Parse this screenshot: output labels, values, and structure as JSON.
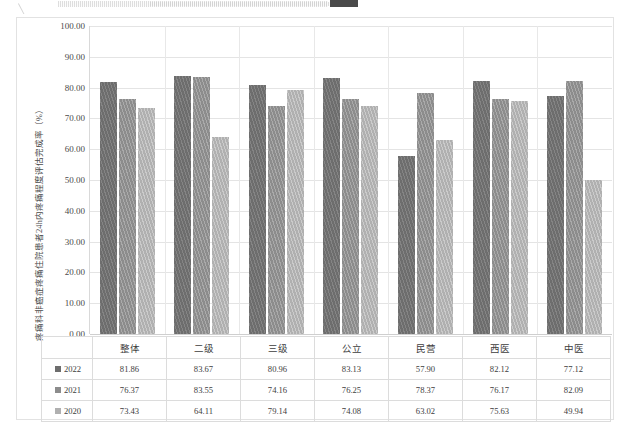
{
  "chart_data": {
    "type": "bar",
    "title": "",
    "xlabel": "",
    "ylabel": "疼痛科非癌症疼痛住院患者24h内疼痛程度评估完成率（%）",
    "ylim": [
      0,
      100
    ],
    "ytick_step": 10,
    "grid": true,
    "legend_position": "bottom",
    "categories": [
      "整体",
      "二级",
      "三级",
      "公立",
      "民营",
      "西医",
      "中医"
    ],
    "ytick_labels": [
      "100.00",
      "90.00",
      "80.00",
      "70.00",
      "60.00",
      "50.00",
      "40.00",
      "30.00",
      "20.00",
      "10.00",
      "0.00"
    ],
    "series": [
      {
        "name": "2022",
        "color": "#6d6d6d",
        "values": [
          81.86,
          83.67,
          80.96,
          83.13,
          57.9,
          82.12,
          77.12
        ]
      },
      {
        "name": "2021",
        "color": "#8c8c8c",
        "values": [
          76.37,
          83.55,
          74.16,
          76.25,
          78.37,
          76.17,
          82.09
        ]
      },
      {
        "name": "2020",
        "color": "#b0b0b0",
        "values": [
          73.43,
          64.11,
          79.14,
          74.08,
          63.02,
          75.63,
          49.94
        ]
      }
    ],
    "value_labels": {
      "2022": [
        "81.86",
        "83.67",
        "80.96",
        "83.13",
        "57.90",
        "82.12",
        "77.12"
      ],
      "2021": [
        "76.37",
        "83.55",
        "74.16",
        "76.25",
        "78.37",
        "76.17",
        "82.09"
      ],
      "2020": [
        "73.43",
        "64.11",
        "79.14",
        "74.08",
        "63.02",
        "75.63",
        "49.94"
      ]
    }
  },
  "legend": {
    "items": [
      {
        "label": "2022",
        "color": "#6d6d6d"
      },
      {
        "label": "2021",
        "color": "#8c8c8c"
      },
      {
        "label": "2020",
        "color": "#b0b0b0"
      }
    ]
  }
}
